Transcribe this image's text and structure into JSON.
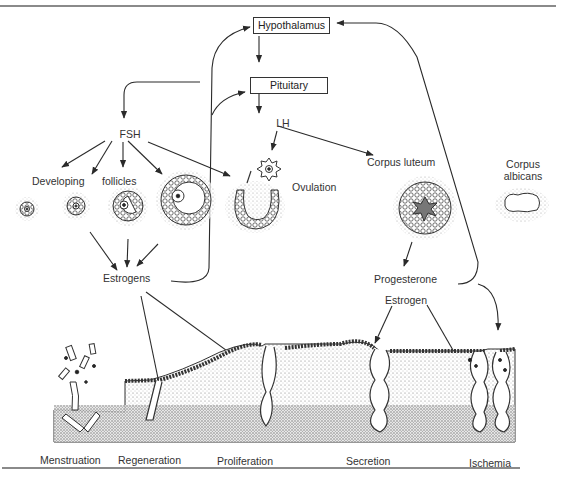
{
  "diagram": {
    "nodes": {
      "hypothalamus": "Hypothalamus",
      "pituitary": "Pituitary",
      "fsh": "FSH",
      "lh": "LH",
      "developing": "Developing",
      "follicles": "follicles",
      "ovulation": "Ovulation",
      "corpus_luteum": "Corpus luteum",
      "corpus_albicans_1": "Corpus",
      "corpus_albicans_2": "albicans",
      "estrogens": "Estrogens",
      "progesterone": "Progesterone",
      "estrogen": "Estrogen"
    },
    "endometrial_stages": [
      "Menstruation",
      "Regeneration",
      "Proliferation",
      "Secretion",
      "Ischemia"
    ],
    "edges": [
      {
        "from": "Hypothalamus",
        "to": "Pituitary"
      },
      {
        "from": "Pituitary",
        "to": "FSH"
      },
      {
        "from": "Pituitary",
        "to": "LH"
      },
      {
        "from": "FSH",
        "to": "Developing follicles"
      },
      {
        "from": "FSH",
        "to": "Ovulation"
      },
      {
        "from": "LH",
        "to": "Ovulation"
      },
      {
        "from": "LH",
        "to": "Corpus luteum"
      },
      {
        "from": "Developing follicles",
        "to": "Estrogens"
      },
      {
        "from": "Estrogens",
        "to": "Hypothalamus",
        "type": "feedback"
      },
      {
        "from": "Estrogens",
        "to": "Pituitary",
        "type": "feedback"
      },
      {
        "from": "Estrogens",
        "to": "Regeneration"
      },
      {
        "from": "Estrogens",
        "to": "Proliferation"
      },
      {
        "from": "Corpus luteum",
        "to": "Progesterone / Estrogen"
      },
      {
        "from": "Progesterone / Estrogen",
        "to": "Hypothalamus",
        "type": "feedback"
      },
      {
        "from": "Progesterone / Estrogen",
        "to": "Secretion"
      },
      {
        "from": "Progesterone / Estrogen",
        "to": "Ischemia"
      }
    ],
    "colors": {
      "ink": "#2a2a2a",
      "rule": "#8a8a8a",
      "background": "#ffffff",
      "stipple": "#9a9a9a"
    }
  }
}
